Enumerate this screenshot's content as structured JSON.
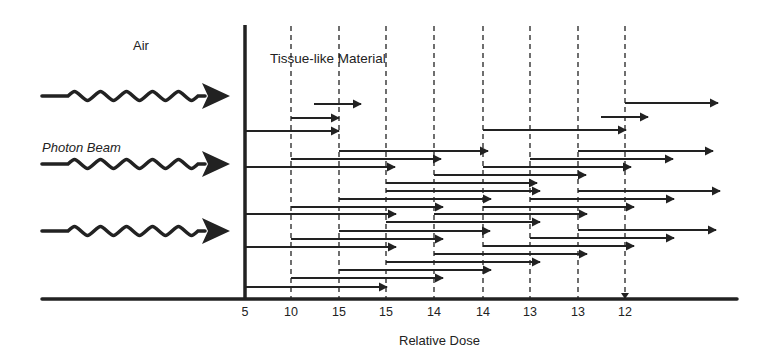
{
  "diagram": {
    "labels": {
      "air": "Air",
      "tissue": "Tissue-like Material",
      "beam": "Photon Beam",
      "xlabel": "Relative Dose"
    },
    "colors": {
      "ink": "#222222",
      "background": "#ffffff"
    },
    "interface_x": 245,
    "baseline_y": 299,
    "columns_x": [
      291,
      339,
      386,
      434,
      483,
      530,
      578,
      625
    ],
    "dose_ticks": [
      {
        "x": 245,
        "label": "5"
      },
      {
        "x": 291,
        "label": "10"
      },
      {
        "x": 339,
        "label": "15"
      },
      {
        "x": 386,
        "label": "15"
      },
      {
        "x": 434,
        "label": "14"
      },
      {
        "x": 483,
        "label": "14"
      },
      {
        "x": 530,
        "label": "13"
      },
      {
        "x": 578,
        "label": "13"
      },
      {
        "x": 625,
        "label": "12"
      }
    ],
    "incident_photons": [
      {
        "y": 96,
        "x1": 42,
        "x2": 230
      },
      {
        "y": 164,
        "x1": 42,
        "x2": 230
      },
      {
        "y": 231,
        "x1": 42,
        "x2": 230
      }
    ],
    "secondary_electrons": [
      {
        "y": 104,
        "x1": 314,
        "x2": 361
      },
      {
        "y": 118,
        "x1": 291,
        "x2": 339
      },
      {
        "y": 131,
        "x1": 245,
        "x2": 339
      },
      {
        "y": 103,
        "x1": 625,
        "x2": 718
      },
      {
        "y": 117,
        "x1": 601,
        "x2": 648
      },
      {
        "y": 130,
        "x1": 483,
        "x2": 626
      },
      {
        "y": 151,
        "x1": 339,
        "x2": 488
      },
      {
        "y": 159,
        "x1": 291,
        "x2": 441
      },
      {
        "y": 167,
        "x1": 245,
        "x2": 395
      },
      {
        "y": 151,
        "x1": 578,
        "x2": 713
      },
      {
        "y": 159,
        "x1": 530,
        "x2": 673
      },
      {
        "y": 167,
        "x1": 483,
        "x2": 631
      },
      {
        "y": 175,
        "x1": 434,
        "x2": 586
      },
      {
        "y": 183,
        "x1": 386,
        "x2": 537
      },
      {
        "y": 191,
        "x1": 386,
        "x2": 540
      },
      {
        "y": 199,
        "x1": 339,
        "x2": 491
      },
      {
        "y": 207,
        "x1": 291,
        "x2": 443
      },
      {
        "y": 214,
        "x1": 245,
        "x2": 396
      },
      {
        "y": 191,
        "x1": 578,
        "x2": 720
      },
      {
        "y": 199,
        "x1": 530,
        "x2": 674
      },
      {
        "y": 207,
        "x1": 483,
        "x2": 634
      },
      {
        "y": 214,
        "x1": 434,
        "x2": 587
      },
      {
        "y": 222,
        "x1": 386,
        "x2": 540
      },
      {
        "y": 230,
        "x1": 578,
        "x2": 716
      },
      {
        "y": 238,
        "x1": 530,
        "x2": 674
      },
      {
        "y": 246,
        "x1": 483,
        "x2": 634
      },
      {
        "y": 231,
        "x1": 339,
        "x2": 490
      },
      {
        "y": 239,
        "x1": 291,
        "x2": 443
      },
      {
        "y": 247,
        "x1": 245,
        "x2": 396
      },
      {
        "y": 254,
        "x1": 434,
        "x2": 587
      },
      {
        "y": 262,
        "x1": 386,
        "x2": 540
      },
      {
        "y": 270,
        "x1": 339,
        "x2": 491
      },
      {
        "y": 278,
        "x1": 291,
        "x2": 443
      },
      {
        "y": 287,
        "x1": 245,
        "x2": 387
      }
    ]
  }
}
